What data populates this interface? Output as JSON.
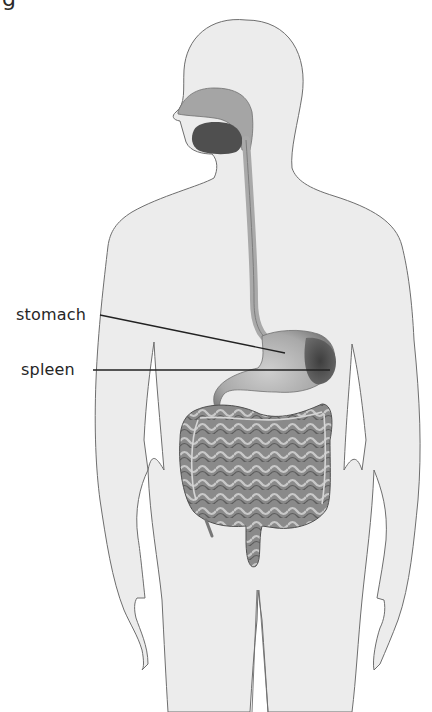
{
  "figure": {
    "corner_glyph": "g",
    "labels": [
      {
        "id": "stomach",
        "text": "stomach"
      },
      {
        "id": "spleen",
        "text": "spleen"
      }
    ]
  },
  "colors": {
    "background": "#ffffff",
    "body_fill": "#ececec",
    "body_outline": "#6e6e6e",
    "organ_light": "#b4b4b4",
    "organ_mid": "#8e8e8e",
    "organ_dark": "#555555",
    "leader_line": "#222222",
    "label_text": "#262626"
  }
}
